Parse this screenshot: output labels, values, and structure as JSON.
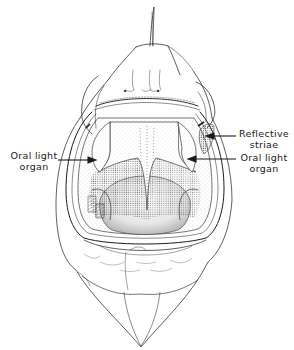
{
  "figure": {
    "line_color": "#1a1a1a",
    "stipple_color": "#333333",
    "background": "#ffffff"
  },
  "annotations": [
    {
      "id": "oral-light-organ-left",
      "line1": "Oral light",
      "line2": "organ",
      "side": "left"
    },
    {
      "id": "reflective-striae",
      "line1": "Reflective",
      "line2": "striae",
      "side": "right"
    },
    {
      "id": "oral-light-organ-right",
      "line1": "Oral light",
      "line2": "organ",
      "side": "right"
    }
  ]
}
